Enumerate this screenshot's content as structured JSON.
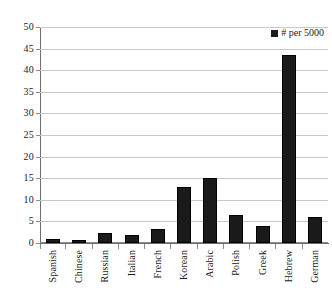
{
  "chart_data": {
    "type": "bar",
    "title": "",
    "subtitle": "",
    "xlabel": "",
    "ylabel": "",
    "ylim": [
      0,
      50
    ],
    "ytick_step": 5,
    "yticks": [
      50,
      45,
      40,
      35,
      30,
      25,
      20,
      15,
      10,
      5,
      0
    ],
    "grid": true,
    "legend_position": "top-right",
    "categories": [
      "Spanish",
      "Chinese",
      "Russian",
      "Italian",
      "French",
      "Korean",
      "Arabic",
      "Polish",
      "Greek",
      "Hebrew",
      "German"
    ],
    "series": [
      {
        "name": "# per 5000",
        "color": "#1a1a1a",
        "values": [
          1,
          0.7,
          2.3,
          1.8,
          3.3,
          13,
          15,
          6.5,
          4,
          43.5,
          6
        ]
      }
    ]
  },
  "legend": {
    "entries": [
      {
        "label": "# per 5000",
        "marker": "square-marker",
        "color": "#1a1a1a"
      }
    ]
  },
  "axes": {
    "y": {
      "tick_labels": [
        "50",
        "45",
        "40",
        "35",
        "30",
        "25",
        "20",
        "15",
        "10",
        "5",
        "0"
      ]
    },
    "x": {
      "tick_labels": [
        "Spanish",
        "Chinese",
        "Russian",
        "Italian",
        "French",
        "Korean",
        "Arabic",
        "Polish",
        "Greek",
        "Hebrew",
        "German"
      ]
    }
  },
  "colors": {
    "bar": "#1a1a1a",
    "gridline": "#c8c8c8",
    "axis": "#6e6e6e",
    "background": "#ffffff",
    "text": "#1a1a1a"
  }
}
